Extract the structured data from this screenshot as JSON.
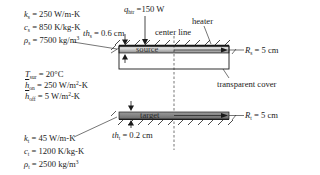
{
  "source_props": {
    "k": {
      "sym": "k",
      "sub": "s",
      "val": "= 250 W/m-K"
    },
    "c": {
      "sym": "c",
      "sub": "s",
      "val": "= 850 K/kg-K"
    },
    "rho": {
      "sym": "ρ",
      "sub": "s",
      "val": "= 7500 kg/m",
      "sup": "3"
    }
  },
  "env_props": {
    "T": {
      "sym": "T",
      "sub": "sur",
      "val": "= 20°C"
    },
    "h_on": {
      "sym": "h",
      "sub": "on",
      "val": "= 250 W/m",
      "sup": "2",
      "tail": "-K"
    },
    "h_off": {
      "sym": "h",
      "sub": "off",
      "val": "= 5 W/m",
      "sup": "2",
      "tail": "-K"
    }
  },
  "target_props": {
    "k": {
      "sym": "k",
      "sub": "t",
      "val": "= 45 W/m-K"
    },
    "c": {
      "sym": "c",
      "sub": "t",
      "val": "= 1200 K/kg-K"
    },
    "rho": {
      "sym": "ρ",
      "sub": "t",
      "val": "= 2500 kg/m",
      "sup": "3"
    }
  },
  "labels": {
    "q_sym": "q",
    "q_sub": "htr",
    "q_val": "=150 W",
    "heater": "heater",
    "center_line": "center line",
    "source": "source",
    "target": "target",
    "transparent_cover": "transparent cover",
    "th_s_sym": "th",
    "th_s_sub": "s",
    "th_s_val": "= 0.6 cm",
    "th_t_sym": "th",
    "th_t_sub": "t",
    "th_t_val": "= 0.2 cm",
    "R_s_sym": "R",
    "R_s_sub": "s",
    "R_s_val": "= 5 cm",
    "R_t_sym": "R",
    "R_t_sub": "t",
    "R_t_val": "= 5 cm"
  },
  "colors": {
    "source_fill_top": "#e6e6e6",
    "source_fill_bottom": "#8c8c8c",
    "target_fill": "#8a8a8a",
    "line": "#1a1a1a"
  }
}
